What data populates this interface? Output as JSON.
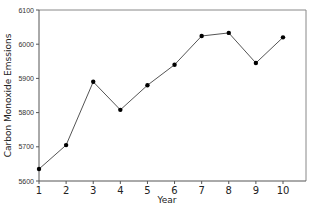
{
  "chart_data": {
    "type": "line",
    "title": "",
    "xlabel": "Year",
    "ylabel": "Carbon Monoxide Emssions",
    "x": [
      1,
      2,
      3,
      4,
      5,
      6,
      7,
      8,
      9,
      10
    ],
    "series": [
      {
        "name": "Carbon Monoxide Emssions",
        "values": [
          5635,
          5705,
          5890,
          5808,
          5880,
          5940,
          6024,
          6033,
          5945,
          6020
        ]
      }
    ],
    "xlim": [
      1,
      10
    ],
    "ylim": [
      5600,
      6100
    ],
    "x_ticks": [
      "1",
      "2",
      "3",
      "4",
      "5",
      "6",
      "7",
      "8",
      "9",
      "10"
    ],
    "y_ticks": [
      "5600",
      "5700",
      "5800",
      "5900",
      "6000",
      "6100"
    ],
    "grid": false,
    "legend": null,
    "colors": {
      "line": "#555555",
      "marker": "#000000",
      "axis": "#555555",
      "frame": "#888888"
    }
  }
}
